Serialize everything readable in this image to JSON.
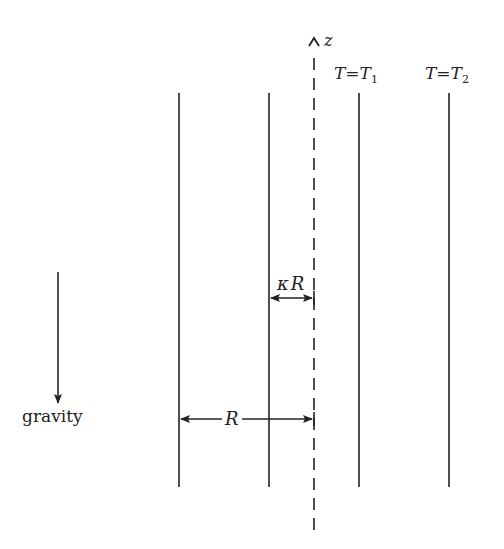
{
  "diagram": {
    "axis": {
      "label": "z",
      "x": 314,
      "y_top": 30,
      "y_bottom": 530,
      "style": "dashed"
    },
    "walls": [
      {
        "name": "outer-wall-left",
        "x": 179
      },
      {
        "name": "inner-wall-left",
        "x": 269
      },
      {
        "name": "inner-wall-right",
        "x": 359
      },
      {
        "name": "outer-wall-right",
        "x": 449
      }
    ],
    "wall_y_top": 93,
    "wall_y_bottom": 487,
    "labels": {
      "t1_lhs": "T",
      "t1_eq": "=",
      "t1_rhs": "T",
      "t1_sub": "1",
      "t2_lhs": "T",
      "t2_eq": "=",
      "t2_rhs": "T",
      "t2_sub": "2",
      "kappa_r_kappa": "κ",
      "kappa_r_r": "R",
      "r_label": "R",
      "gravity": "gravity",
      "z": "z"
    },
    "colors": {
      "stroke": "#222222",
      "background": "#ffffff"
    }
  }
}
